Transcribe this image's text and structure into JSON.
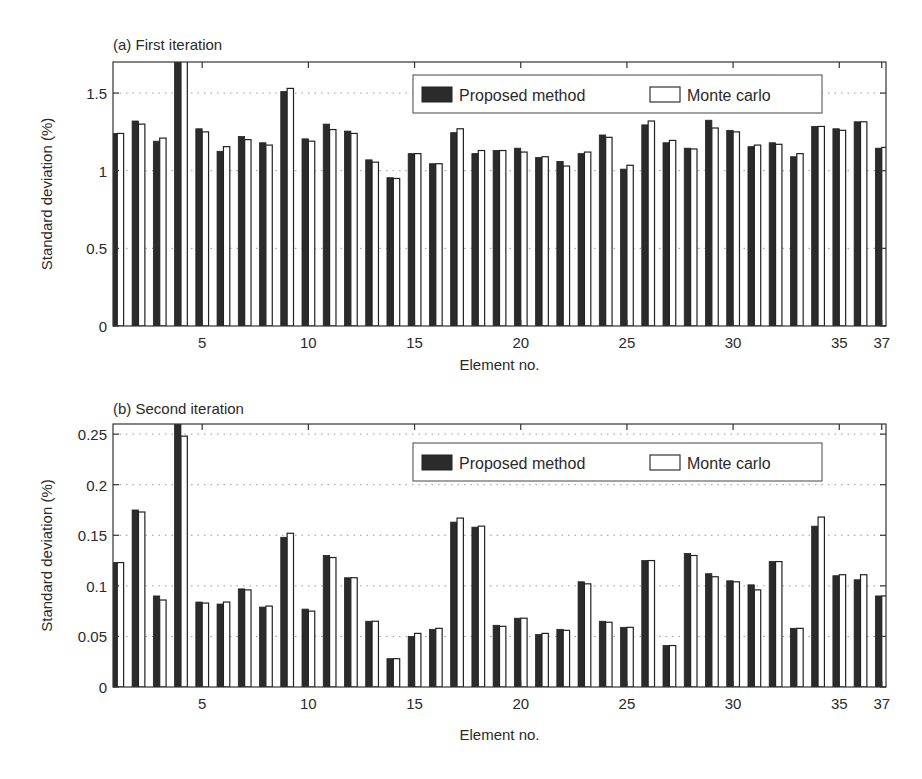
{
  "figure": {
    "background": "#ffffff",
    "colors": {
      "proposed_fill": "#2b2b2b",
      "montecarlo_fill": "#ffffff",
      "bar_stroke": "#222222",
      "axis": "#333333",
      "grid": "#999999",
      "text": "#2a2a2a"
    }
  },
  "chart_data": [
    {
      "type": "bar",
      "panel": "a",
      "title": "(a) First iteration",
      "xlabel": "Element no.",
      "ylabel": "Standard deviation (%)",
      "xlim": [
        0.8,
        37.2
      ],
      "ylim": [
        0,
        1.7
      ],
      "xticks": [
        5,
        10,
        15,
        20,
        25,
        30,
        35,
        37
      ],
      "yticks": [
        0,
        0.5,
        1,
        1.5
      ],
      "ytick_labels": [
        "0",
        "0.5",
        "1",
        "1.5"
      ],
      "grid": "horizontal dotted",
      "legend": {
        "position": "upper right",
        "entries": [
          "Proposed method",
          "Monte carlo"
        ]
      },
      "categories": [
        1,
        2,
        3,
        4,
        5,
        6,
        7,
        8,
        9,
        10,
        11,
        12,
        13,
        14,
        15,
        16,
        17,
        18,
        19,
        20,
        21,
        22,
        23,
        24,
        25,
        26,
        27,
        28,
        29,
        30,
        31,
        32,
        33,
        34,
        35,
        36,
        37
      ],
      "series": [
        {
          "name": "Proposed method",
          "values": [
            1.24,
            1.32,
            1.19,
            1.72,
            1.27,
            1.125,
            1.22,
            1.18,
            1.51,
            1.205,
            1.3,
            1.255,
            1.07,
            0.955,
            1.11,
            1.045,
            1.245,
            1.11,
            1.13,
            1.145,
            1.085,
            1.06,
            1.11,
            1.23,
            1.01,
            1.295,
            1.18,
            1.145,
            1.325,
            1.26,
            1.155,
            1.18,
            1.09,
            1.285,
            1.27,
            1.315,
            1.145
          ]
        },
        {
          "name": "Monte carlo",
          "values": [
            1.24,
            1.3,
            1.21,
            1.75,
            1.25,
            1.155,
            1.2,
            1.165,
            1.53,
            1.19,
            1.265,
            1.24,
            1.055,
            0.95,
            1.11,
            1.045,
            1.27,
            1.13,
            1.13,
            1.12,
            1.09,
            1.03,
            1.12,
            1.215,
            1.035,
            1.32,
            1.195,
            1.14,
            1.275,
            1.25,
            1.165,
            1.17,
            1.11,
            1.285,
            1.26,
            1.315,
            1.15
          ]
        }
      ]
    },
    {
      "type": "bar",
      "panel": "b",
      "title": "(b) Second iteration",
      "xlabel": "Element no.",
      "ylabel": "Standard deviation (%)",
      "xlim": [
        0.8,
        37.2
      ],
      "ylim": [
        0,
        0.26
      ],
      "xticks": [
        5,
        10,
        15,
        20,
        25,
        30,
        35,
        37
      ],
      "yticks": [
        0,
        0.05,
        0.1,
        0.15,
        0.2,
        0.25
      ],
      "ytick_labels": [
        "0",
        "0.05",
        "0.1",
        "0.15",
        "0.2",
        "0.25"
      ],
      "grid": "horizontal dotted",
      "legend": {
        "position": "upper right",
        "entries": [
          "Proposed method",
          "Monte carlo"
        ]
      },
      "categories": [
        1,
        2,
        3,
        4,
        5,
        6,
        7,
        8,
        9,
        10,
        11,
        12,
        13,
        14,
        15,
        16,
        17,
        18,
        19,
        20,
        21,
        22,
        23,
        24,
        25,
        26,
        27,
        28,
        29,
        30,
        31,
        32,
        33,
        34,
        35,
        36,
        37
      ],
      "series": [
        {
          "name": "Proposed method",
          "values": [
            0.123,
            0.175,
            0.09,
            0.265,
            0.084,
            0.082,
            0.097,
            0.079,
            0.148,
            0.077,
            0.13,
            0.108,
            0.065,
            0.028,
            0.05,
            0.057,
            0.163,
            0.158,
            0.061,
            0.068,
            0.052,
            0.057,
            0.104,
            0.065,
            0.059,
            0.125,
            0.041,
            0.132,
            0.112,
            0.105,
            0.101,
            0.124,
            0.058,
            0.159,
            0.11,
            0.106,
            0.09
          ]
        },
        {
          "name": "Monte carlo",
          "values": [
            0.123,
            0.173,
            0.086,
            0.248,
            0.083,
            0.084,
            0.096,
            0.08,
            0.152,
            0.075,
            0.128,
            0.108,
            0.065,
            0.028,
            0.053,
            0.058,
            0.167,
            0.159,
            0.06,
            0.068,
            0.053,
            0.056,
            0.102,
            0.064,
            0.059,
            0.125,
            0.041,
            0.13,
            0.109,
            0.104,
            0.096,
            0.124,
            0.058,
            0.168,
            0.111,
            0.111,
            0.09
          ]
        }
      ]
    }
  ]
}
